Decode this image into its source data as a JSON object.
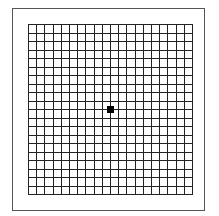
{
  "figure": {
    "type": "amsler-grid",
    "rows": 20,
    "columns": 20,
    "line_color": "#222222",
    "frame_color": "#555555",
    "center_dot": {
      "color": "#000000",
      "size_px": 7
    }
  }
}
